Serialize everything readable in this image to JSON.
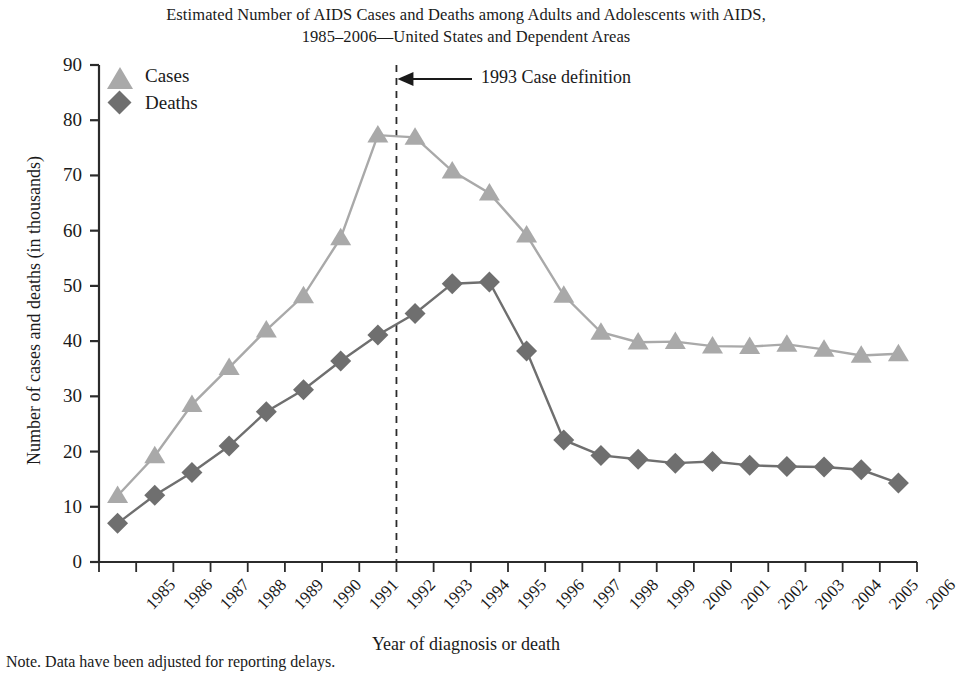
{
  "title": {
    "line1": "Estimated Number of AIDS Cases and Deaths among Adults and Adolescents with AIDS,",
    "line2": "1985–2006—United States and Dependent Areas"
  },
  "axes": {
    "ylabel": "Number of cases and deaths (in thousands)",
    "xlabel": "Year of diagnosis or death",
    "yticks": [
      "0",
      "10",
      "20",
      "30",
      "40",
      "50",
      "60",
      "70",
      "80",
      "90"
    ]
  },
  "legend": {
    "cases_label": "Cases",
    "deaths_label": "Deaths",
    "cases_icon": "triangle-marker-icon",
    "deaths_icon": "diamond-marker-icon"
  },
  "annotation": {
    "text": "1993 Case definition",
    "at_year": "1993",
    "arrow_icon": "left-arrow-icon"
  },
  "note": "Note. Data have been adjusted for reporting delays.",
  "colors": {
    "cases": "#a9a9a9",
    "deaths": "#6f6f6f",
    "axis": "#2b2b2b",
    "background": "#ffffff"
  },
  "chart_data": {
    "type": "line",
    "title": "Estimated Number of AIDS Cases and Deaths among Adults and Adolescents with AIDS, 1985–2006—United States and Dependent Areas",
    "xlabel": "Year of diagnosis or death",
    "ylabel": "Number of cases and deaths (in thousands)",
    "xlim": [
      1985,
      2006
    ],
    "ylim": [
      0,
      90
    ],
    "ytick_step": 10,
    "grid": false,
    "legend_position": "top-left",
    "categories": [
      "1985",
      "1986",
      "1987",
      "1988",
      "1989",
      "1990",
      "1991",
      "1992",
      "1993",
      "1994",
      "1995",
      "1996",
      "1997",
      "1998",
      "1999",
      "2000",
      "2001",
      "2002",
      "2003",
      "2004",
      "2005",
      "2006"
    ],
    "series": [
      {
        "name": "Cases",
        "marker": "triangle",
        "color": "#a9a9a9",
        "values": [
          12.0,
          19.2,
          28.5,
          35.2,
          42.0,
          48.2,
          58.7,
          77.3,
          76.9,
          70.8,
          66.8,
          59.2,
          48.3,
          41.6,
          39.8,
          39.9,
          39.1,
          39.0,
          39.4,
          38.5,
          37.4,
          37.7
        ]
      },
      {
        "name": "Deaths",
        "marker": "diamond",
        "color": "#6f6f6f",
        "values": [
          7.0,
          12.1,
          16.2,
          21.0,
          27.2,
          31.2,
          36.4,
          41.1,
          45.0,
          50.4,
          50.7,
          38.2,
          22.1,
          19.3,
          18.6,
          17.9,
          18.2,
          17.5,
          17.3,
          17.2,
          16.7,
          14.3
        ]
      }
    ],
    "annotations": [
      {
        "text": "1993 Case definition",
        "x": 1992.5,
        "y": 87,
        "style": "dashed-vline-with-left-arrow"
      }
    ]
  }
}
